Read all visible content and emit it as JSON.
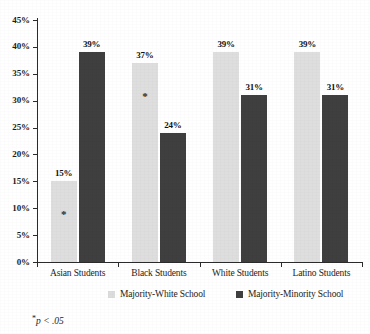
{
  "chart_data": {
    "type": "bar",
    "title": "",
    "xlabel": "",
    "ylabel": "",
    "categories": [
      "Asian Students",
      "Black Students",
      "White Students",
      "Latino Students"
    ],
    "series": [
      {
        "name": "Majority-White School",
        "color": "#dedede",
        "values": [
          15,
          37,
          39,
          39
        ],
        "value_labels": [
          "15%",
          "37%",
          "39%",
          "39%"
        ],
        "significance": [
          "*",
          "*",
          "",
          ""
        ]
      },
      {
        "name": "Majority-Minority School",
        "color": "#3f3f3f",
        "values": [
          39,
          24,
          31,
          31
        ],
        "value_labels": [
          "39%",
          "24%",
          "31%",
          "31%"
        ],
        "significance": [
          "",
          "",
          "",
          ""
        ]
      }
    ],
    "ylim": [
      0,
      45
    ],
    "ytick_values": [
      0,
      5,
      10,
      15,
      20,
      25,
      30,
      35,
      40,
      45
    ],
    "ytick_labels": [
      "0%",
      "5%",
      "10%",
      "15%",
      "20%",
      "25%",
      "30%",
      "35%",
      "40%",
      "45%"
    ],
    "grid": false,
    "legend_position": "bottom"
  },
  "legend": {
    "items": [
      {
        "label": "Majority-White School",
        "swatch": "light"
      },
      {
        "label": "Majority-Minority School",
        "swatch": "dark"
      }
    ]
  },
  "footnote": {
    "star": "*",
    "text": "p < .05"
  }
}
